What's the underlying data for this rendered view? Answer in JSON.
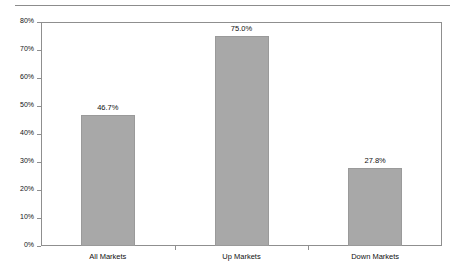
{
  "chart_data": {
    "type": "bar",
    "title": "",
    "subtitle": "",
    "xlabel": "",
    "ylabel": "",
    "categories": [
      "All Markets",
      "Up Markets",
      "Down Markets"
    ],
    "values": [
      46.7,
      75.0,
      27.8
    ],
    "data_labels": [
      "46.7%",
      "75.0%",
      "27.8%"
    ],
    "ylim": [
      0,
      80
    ],
    "y_ticks": [
      0,
      10,
      20,
      30,
      40,
      50,
      60,
      70,
      80
    ],
    "y_tick_labels": [
      "0%",
      "10%",
      "20%",
      "30%",
      "40%",
      "50%",
      "60%",
      "70%",
      "80%"
    ],
    "grid": false,
    "legend": null,
    "legend_position": "none",
    "bar_color": "#a8a8a8",
    "bar_border_color": "#9a9a9a",
    "axis_color": "#8f8f8f",
    "text_color": "#111111",
    "background_color": "#ffffff"
  },
  "decor": {
    "top_rule_color": "#8c8c8c"
  }
}
